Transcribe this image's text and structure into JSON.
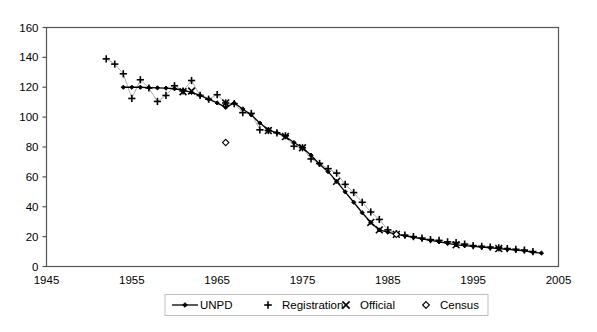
{
  "chart_data": {
    "type": "line",
    "title": "",
    "subtitle": "",
    "xlabel": "",
    "ylabel": "",
    "xlim": [
      1945,
      2005
    ],
    "ylim": [
      0,
      160
    ],
    "x_ticks": [
      1945,
      1955,
      1965,
      1975,
      1985,
      1995,
      2005
    ],
    "y_ticks": [
      0,
      20,
      40,
      60,
      80,
      100,
      120,
      140,
      160
    ],
    "grid": "horizontal",
    "legend_position": "bottom",
    "series": [
      {
        "name": "UNPD",
        "marker": "filled-diamond",
        "style": "line-with-markers",
        "points": [
          [
            1954,
            120.0
          ],
          [
            1955,
            120.0
          ],
          [
            1956,
            120.0
          ],
          [
            1957,
            119.8
          ],
          [
            1958,
            119.6
          ],
          [
            1959,
            119.4
          ],
          [
            1960,
            119.0
          ],
          [
            1961,
            118.0
          ],
          [
            1962,
            116.5
          ],
          [
            1963,
            114.5
          ],
          [
            1964,
            112.0
          ],
          [
            1965,
            109.5
          ],
          [
            1966,
            106.5
          ],
          [
            1967,
            109.5
          ],
          [
            1968,
            105.5
          ],
          [
            1969,
            101.5
          ],
          [
            1970,
            96.0
          ],
          [
            1971,
            91.5
          ],
          [
            1972,
            89.5
          ],
          [
            1973,
            87.0
          ],
          [
            1974,
            83.0
          ],
          [
            1975,
            79.5
          ],
          [
            1976,
            74.5
          ],
          [
            1977,
            68.5
          ],
          [
            1978,
            63.5
          ],
          [
            1979,
            57.0
          ],
          [
            1980,
            50.0
          ],
          [
            1981,
            43.0
          ],
          [
            1982,
            36.0
          ],
          [
            1983,
            29.5
          ],
          [
            1984,
            24.5
          ],
          [
            1985,
            23.0
          ],
          [
            1986,
            21.5
          ],
          [
            1987,
            20.5
          ],
          [
            1988,
            19.5
          ],
          [
            1989,
            18.5
          ],
          [
            1990,
            17.5
          ],
          [
            1991,
            16.5
          ],
          [
            1992,
            15.5
          ],
          [
            1993,
            14.5
          ],
          [
            1994,
            14.0
          ],
          [
            1995,
            13.5
          ],
          [
            1996,
            13.0
          ],
          [
            1997,
            12.5
          ],
          [
            1998,
            12.0
          ],
          [
            1999,
            11.5
          ],
          [
            2000,
            11.0
          ],
          [
            2001,
            10.5
          ],
          [
            2002,
            9.5
          ],
          [
            2003,
            9.0
          ]
        ]
      },
      {
        "name": "Registration",
        "marker": "plus",
        "style": "markers-only",
        "points": [
          [
            1952,
            139.0
          ],
          [
            1953,
            135.5
          ],
          [
            1954,
            129.0
          ],
          [
            1955,
            112.5
          ],
          [
            1956,
            125.0
          ],
          [
            1957,
            119.5
          ],
          [
            1958,
            110.5
          ],
          [
            1959,
            114.5
          ],
          [
            1960,
            121.0
          ],
          [
            1961,
            117.5
          ],
          [
            1962,
            124.5
          ],
          [
            1963,
            114.5
          ],
          [
            1964,
            112.0
          ],
          [
            1965,
            115.0
          ],
          [
            1966,
            109.5
          ],
          [
            1967,
            109.0
          ],
          [
            1968,
            103.0
          ],
          [
            1969,
            102.5
          ],
          [
            1970,
            91.5
          ],
          [
            1971,
            91.0
          ],
          [
            1972,
            89.5
          ],
          [
            1973,
            87.5
          ],
          [
            1974,
            80.5
          ],
          [
            1975,
            79.5
          ],
          [
            1976,
            72.0
          ],
          [
            1977,
            69.0
          ],
          [
            1978,
            65.5
          ],
          [
            1979,
            62.5
          ],
          [
            1980,
            55.0
          ],
          [
            1981,
            49.5
          ],
          [
            1982,
            43.0
          ],
          [
            1983,
            36.5
          ],
          [
            1984,
            31.5
          ],
          [
            1985,
            24.5
          ],
          [
            1986,
            22.0
          ],
          [
            1987,
            21.0
          ],
          [
            1988,
            20.0
          ],
          [
            1989,
            19.0
          ],
          [
            1990,
            18.0
          ],
          [
            1991,
            17.5
          ],
          [
            1992,
            16.5
          ],
          [
            1993,
            16.0
          ],
          [
            1994,
            15.0
          ],
          [
            1995,
            14.0
          ],
          [
            1996,
            13.5
          ],
          [
            1997,
            13.0
          ],
          [
            1998,
            12.5
          ],
          [
            1999,
            12.0
          ],
          [
            2000,
            11.5
          ],
          [
            2001,
            11.0
          ],
          [
            2002,
            10.0
          ]
        ]
      },
      {
        "name": "Official",
        "marker": "cross",
        "style": "markers-only",
        "points": [
          [
            1961,
            117.0
          ],
          [
            1962,
            117.5
          ],
          [
            1966,
            109.5
          ],
          [
            1971,
            91.0
          ],
          [
            1973,
            87.0
          ],
          [
            1975,
            79.5
          ],
          [
            1979,
            57.0
          ],
          [
            1983,
            29.5
          ],
          [
            1984,
            24.5
          ],
          [
            1986,
            21.5
          ],
          [
            1993,
            14.5
          ],
          [
            1998,
            12.0
          ]
        ]
      },
      {
        "name": "Census",
        "marker": "open-diamond",
        "style": "markers-only",
        "points": [
          [
            1966,
            83.0
          ],
          [
            1986,
            21.5
          ]
        ]
      }
    ]
  },
  "legend": {
    "items": [
      {
        "label": "UNPD",
        "marker": "line-diamond"
      },
      {
        "label": "Registration",
        "marker": "plus"
      },
      {
        "label": "Official",
        "marker": "cross"
      },
      {
        "label": "Census",
        "marker": "open-diamond"
      }
    ]
  },
  "axes": {
    "x_tick_labels": [
      "1945",
      "1955",
      "1965",
      "1975",
      "1985",
      "1995",
      "2005"
    ],
    "y_tick_labels": [
      "0",
      "20",
      "40",
      "60",
      "80",
      "100",
      "120",
      "140",
      "160"
    ]
  },
  "colors": {
    "background": "#ffffff",
    "gridline": "#bfbfbf",
    "axis": "#555555",
    "series": "#000000"
  }
}
